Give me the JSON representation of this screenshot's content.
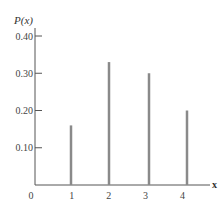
{
  "chart_data": {
    "type": "bar",
    "style": "stick",
    "title": "",
    "xlabel": "x",
    "ylabel": "P(x)",
    "categories": [
      "1",
      "2",
      "3",
      "4"
    ],
    "x": [
      1,
      2,
      3,
      4
    ],
    "values": [
      0.16,
      0.33,
      0.3,
      0.2
    ],
    "y_ticks": [
      "0.10",
      "0.20",
      "0.30",
      "0.40"
    ],
    "y_tick_values": [
      0.1,
      0.2,
      0.3,
      0.4
    ],
    "x_ticks": [
      "0",
      "1",
      "2",
      "3",
      "4"
    ],
    "ylim": [
      0,
      0.4
    ],
    "xlim": [
      0,
      4.5
    ],
    "grid": false,
    "legend": null,
    "bar_color": "#8a8a8a",
    "axis_color": "#555555"
  }
}
